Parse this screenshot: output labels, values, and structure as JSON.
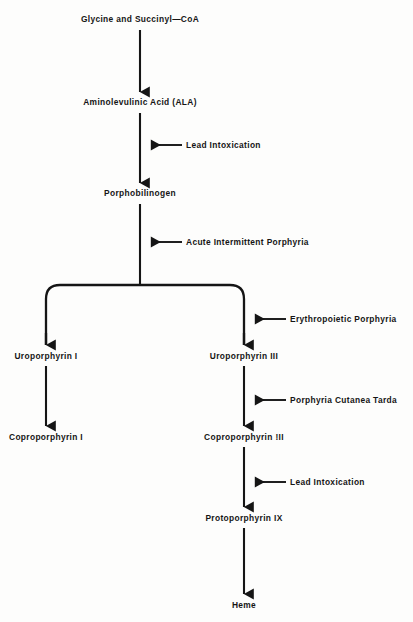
{
  "figure": {
    "type": "flowchart",
    "background_color": "#fdfdfc",
    "ink_color": "#151515"
  },
  "nodes": [
    {
      "id": "glycine",
      "label": "Glycine and Succinyl—CoA",
      "x": 140,
      "y": 22,
      "column": "main"
    },
    {
      "id": "ala",
      "label": "Aminolevulinic Acid (ALA)",
      "x": 140,
      "y": 105,
      "column": "main"
    },
    {
      "id": "porphobilinogen",
      "label": "Porphobilinogen",
      "x": 140,
      "y": 196,
      "column": "main"
    },
    {
      "id": "uro1",
      "label": "Uroporphyrin I",
      "x": 46,
      "y": 358,
      "column": "left"
    },
    {
      "id": "uro3",
      "label": "Uroporphyrin III",
      "x": 244,
      "y": 358,
      "column": "right"
    },
    {
      "id": "copro1",
      "label": "Coproporphyrin I",
      "x": 46,
      "y": 439,
      "column": "left"
    },
    {
      "id": "copro3",
      "label": "Coproporphyrin !II",
      "x": 244,
      "y": 439,
      "column": "right"
    },
    {
      "id": "proto9",
      "label": "Protoporphyrin IX",
      "x": 244,
      "y": 520,
      "column": "right"
    },
    {
      "id": "heme",
      "label": "Heme",
      "x": 244,
      "y": 607,
      "column": "right"
    }
  ],
  "annotations": [
    {
      "id": "lead-1",
      "label": "Lead Intoxication",
      "text_x": 186,
      "text_y": 141,
      "arrow_tip_x": 150,
      "arrow_tail_x": 182,
      "arrow_y": 145
    },
    {
      "id": "aip",
      "label": "Acute Intermittent Porphyria",
      "text_x": 186,
      "text_y": 238,
      "arrow_tip_x": 150,
      "arrow_tail_x": 182,
      "arrow_y": 242
    },
    {
      "id": "ep",
      "label": "Erythropoietic Porphyria",
      "text_x": 290,
      "text_y": 315,
      "arrow_tip_x": 254,
      "arrow_tail_x": 286,
      "arrow_y": 319
    },
    {
      "id": "pct",
      "label": "Porphyria Cutanea Tarda",
      "text_x": 290,
      "text_y": 396,
      "arrow_tip_x": 254,
      "arrow_tail_x": 286,
      "arrow_y": 400
    },
    {
      "id": "lead-2",
      "label": "Lead Intoxication",
      "text_x": 290,
      "text_y": 478,
      "arrow_tip_x": 254,
      "arrow_tail_x": 286,
      "arrow_y": 482
    }
  ],
  "branch": {
    "id": "uro-branch",
    "description": "Porphobilinogen splits into Uroporphyrin I and Uroporphyrin III",
    "bar_y": 285,
    "left_x": 46,
    "right_x": 244,
    "stem_x": 140,
    "corner_radius": 14
  }
}
